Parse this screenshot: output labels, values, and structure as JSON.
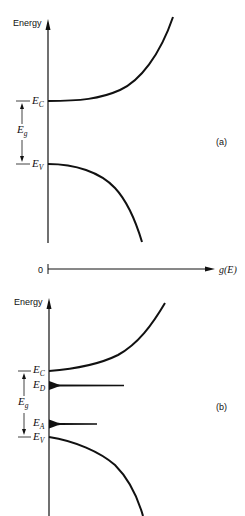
{
  "figure": {
    "panel_a": {
      "y_axis_label": "Energy",
      "tag": "(a)",
      "levels": [
        {
          "symbol": "E",
          "sub": "C"
        },
        {
          "symbol": "E",
          "sub": "V"
        }
      ],
      "gap_label": {
        "symbol": "E",
        "sub": "g"
      }
    },
    "x_axis": {
      "origin_label": "0",
      "label": "g(E)"
    },
    "panel_b": {
      "y_axis_label": "Energy",
      "tag": "(b)",
      "levels": [
        {
          "symbol": "E",
          "sub": "C"
        },
        {
          "symbol": "E",
          "sub": "D"
        },
        {
          "symbol": "E",
          "sub": "A"
        },
        {
          "symbol": "E",
          "sub": "V"
        }
      ],
      "gap_label": {
        "symbol": "E",
        "sub": "g"
      }
    }
  }
}
